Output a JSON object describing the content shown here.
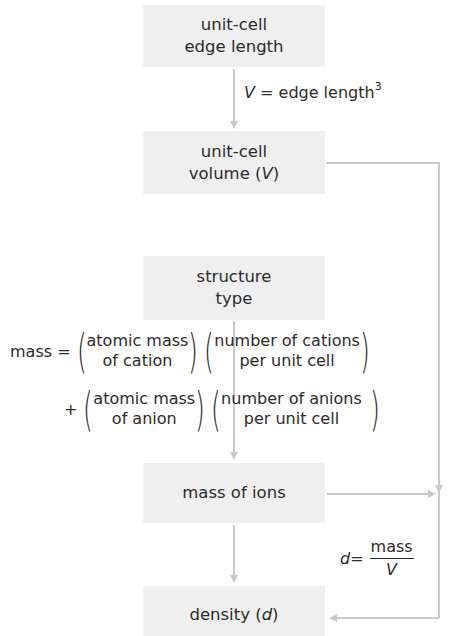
{
  "diagram": {
    "type": "flowchart",
    "nodes": [
      {
        "id": "edge",
        "line1": "unit-cell",
        "line2": "edge length"
      },
      {
        "id": "volume",
        "line1": "unit-cell",
        "line2_prefix": "volume (",
        "line2_var": "V",
        "line2_suffix": ")"
      },
      {
        "id": "structure",
        "line1": "structure",
        "line2": "type"
      },
      {
        "id": "mass",
        "line1": "mass of ions"
      },
      {
        "id": "density",
        "prefix": "density (",
        "var": "d",
        "suffix": ")"
      }
    ],
    "edge_labels": {
      "volume_formula": {
        "var": "V",
        "eq": " = edge length",
        "exp": "3"
      },
      "mass_formula": {
        "lhs": "mass =",
        "plus": "+",
        "term1_a": {
          "line1": "atomic mass",
          "line2": "of cation"
        },
        "term1_b": {
          "line1": "number of cations",
          "line2": "per unit cell"
        },
        "term2_a": {
          "line1": "atomic mass",
          "line2": "of anion"
        },
        "term2_b": {
          "line1": "number of anions",
          "line2": "per unit cell"
        }
      },
      "density_formula": {
        "var": "d",
        "eq": " =",
        "numerator": "mass",
        "denominator": "V"
      }
    },
    "edges": [
      {
        "from": "edge",
        "to": "volume"
      },
      {
        "from": "structure",
        "to": "mass"
      },
      {
        "from": "mass",
        "to": "density"
      },
      {
        "from": "volume",
        "to": "density",
        "via": "right"
      },
      {
        "from": "mass",
        "to": "density",
        "via": "right"
      }
    ],
    "colors": {
      "box_fill": "#efefef",
      "line": "#c9c9c9",
      "text": "#2b2b2b"
    }
  }
}
